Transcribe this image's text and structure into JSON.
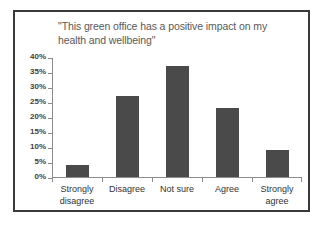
{
  "chart_data": {
    "type": "bar",
    "title": "\"This green office has a positive impact on my\nhealth and wellbeing\"",
    "xlabel": "",
    "ylabel": "",
    "categories": [
      "Strongly disagree",
      "Disagree",
      "Not sure",
      "Agree",
      "Strongly agree"
    ],
    "category_labels_wrapped": [
      "Strongly\ndisagree",
      "Disagree",
      "Not sure",
      "Agree",
      "Strongly\nagree"
    ],
    "values": [
      4,
      27,
      37,
      23,
      9
    ],
    "value_unit": "%",
    "ylim": [
      0,
      40
    ],
    "ytick_step": 5,
    "ytick_labels": [
      "40%",
      "35%",
      "30%",
      "25%",
      "20%",
      "15%",
      "10%",
      "5%",
      "0%"
    ],
    "ytick_values": [
      40,
      35,
      30,
      25,
      20,
      15,
      10,
      5,
      0
    ],
    "grid": false,
    "legend": "none",
    "bar_color": "#4a4a4a",
    "axis_color": "#8c8c8c",
    "title_color": "#595959",
    "border_color": "#3a3a3a",
    "background": "#ffffff"
  }
}
